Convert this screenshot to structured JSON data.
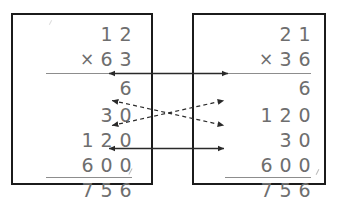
{
  "figure": {
    "background_color": "#ffffff",
    "panel_border_color": "#1b1b1b",
    "digit_color": "#6e6e6e",
    "rule_color": "#8d8d8d",
    "connector_color": "#2a2a2a"
  },
  "panels": [
    {
      "id": "left",
      "name": "left-multiplication-panel",
      "multiplicand": [
        "1",
        "2"
      ],
      "multiplier": [
        "6",
        "3"
      ],
      "operator": "×",
      "partial_products": [
        {
          "digits": [
            "",
            "",
            "6"
          ],
          "value": "6"
        },
        {
          "digits": [
            "",
            "3",
            "0"
          ],
          "value": "30"
        },
        {
          "digits": [
            "1",
            "2",
            "0"
          ],
          "value": "120"
        },
        {
          "digits": [
            "6",
            "0",
            "0"
          ],
          "value": "600"
        }
      ],
      "total": [
        "7",
        "5",
        "6"
      ],
      "total_value": "756"
    },
    {
      "id": "right",
      "name": "right-multiplication-panel",
      "multiplicand": [
        "2",
        "1"
      ],
      "multiplier": [
        "3",
        "6"
      ],
      "operator": "×",
      "partial_products": [
        {
          "digits": [
            "",
            "",
            "6"
          ],
          "value": "6"
        },
        {
          "digits": [
            "1",
            "2",
            "0"
          ],
          "value": "120"
        },
        {
          "digits": [
            "",
            "3",
            "0"
          ],
          "value": "30"
        },
        {
          "digits": [
            "6",
            "0",
            "0"
          ],
          "value": "600"
        }
      ],
      "total": [
        "7",
        "5",
        "6"
      ],
      "total_value": "756"
    }
  ],
  "connectors": [
    {
      "name": "connector-6",
      "style": "solid",
      "from": "left-partial-1",
      "to": "right-partial-1",
      "crossed": false,
      "arrowheads": "both"
    },
    {
      "name": "connector-30",
      "style": "dashed",
      "from": "left-partial-2",
      "to": "right-partial-3",
      "crossed": true,
      "arrowheads": "both"
    },
    {
      "name": "connector-120",
      "style": "dashed",
      "from": "left-partial-3",
      "to": "right-partial-2",
      "crossed": true,
      "arrowheads": "both"
    },
    {
      "name": "connector-600",
      "style": "solid",
      "from": "left-partial-4",
      "to": "right-partial-4",
      "crossed": false,
      "arrowheads": "both"
    }
  ]
}
